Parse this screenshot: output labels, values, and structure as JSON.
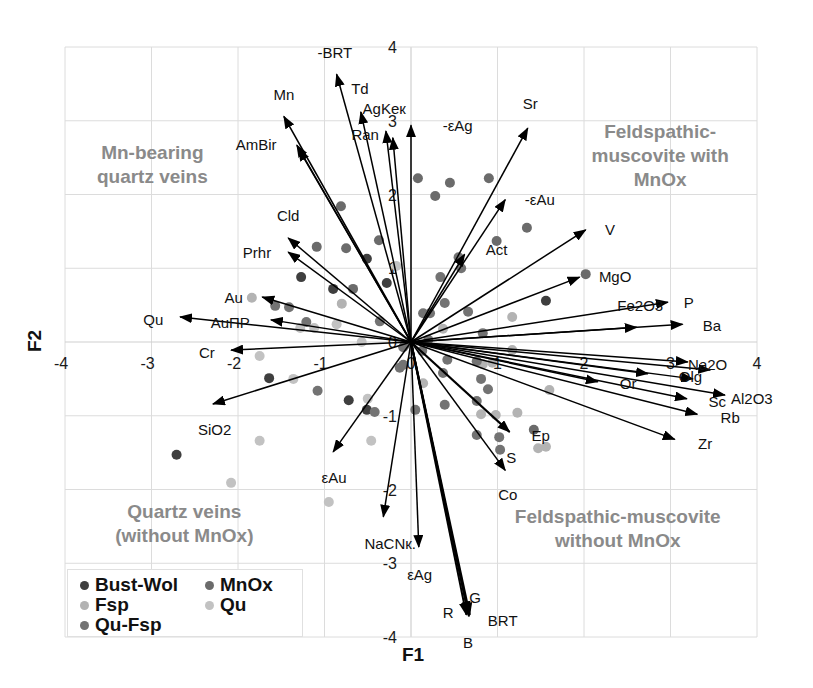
{
  "chart_data": {
    "type": "scatter",
    "subtype": "PCA biplot (points + variable vectors)",
    "title": "",
    "xlabel": "F1",
    "ylabel": "F2",
    "xlim": [
      -4,
      4
    ],
    "ylim": [
      -4,
      4
    ],
    "x_ticks": [
      -4,
      -3,
      -2,
      -1,
      0,
      1,
      2,
      3,
      4
    ],
    "y_ticks": [
      -4,
      -3,
      -2,
      -1,
      0,
      1,
      2,
      3,
      4
    ],
    "grid": true,
    "legend_position": "bottom-left",
    "series": [
      {
        "name": "Bust-Wol",
        "color": "#3f3f3f",
        "points": [
          [
            -0.51,
            1.13
          ],
          [
            -1.27,
            0.88
          ],
          [
            -0.28,
            0.8
          ],
          [
            1.56,
            0.56
          ],
          [
            -0.9,
            0.72
          ],
          [
            -1.64,
            -0.49
          ],
          [
            -0.72,
            -0.79
          ],
          [
            -0.51,
            -0.92
          ],
          [
            -2.71,
            -1.53
          ]
        ]
      },
      {
        "name": "MnOx",
        "color": "#6b6b6b",
        "points": [
          [
            0.08,
            2.22
          ],
          [
            0.45,
            2.16
          ],
          [
            0.9,
            2.22
          ],
          [
            0.28,
            1.98
          ],
          [
            -0.81,
            1.84
          ],
          [
            1.34,
            1.55
          ],
          [
            0.99,
            1.37
          ],
          [
            -1.09,
            1.29
          ],
          [
            -0.75,
            1.27
          ],
          [
            -0.37,
            1.38
          ],
          [
            2.02,
            0.92
          ],
          [
            -0.67,
            0.72
          ],
          [
            1.42,
            -1.19
          ]
        ]
      },
      {
        "name": "Fsp",
        "color": "#b3b3b3",
        "points": [
          [
            1.17,
            0.34
          ],
          [
            0.37,
            0.18
          ],
          [
            -1.84,
            0.6
          ],
          [
            -0.8,
            0.52
          ],
          [
            0.83,
            -0.3
          ],
          [
            0.94,
            -0.28
          ],
          [
            1.6,
            -0.65
          ],
          [
            0.81,
            -0.98
          ],
          [
            0.98,
            -0.99
          ],
          [
            1.23,
            -0.96
          ],
          [
            1.47,
            -1.44
          ],
          [
            1.56,
            -1.42
          ],
          [
            1.17,
            -0.11
          ],
          [
            0.14,
            -0.56
          ]
        ]
      },
      {
        "name": "Qu",
        "color": "#c2c2c2",
        "points": [
          [
            -0.17,
            1.03
          ],
          [
            -1.28,
            0.19
          ],
          [
            -1.12,
            0.19
          ],
          [
            -0.86,
            0.24
          ],
          [
            -0.57,
            0.0
          ],
          [
            -1.75,
            -0.19
          ],
          [
            -1.36,
            -0.5
          ],
          [
            -0.5,
            -0.77
          ],
          [
            -1.75,
            -1.34
          ],
          [
            -2.08,
            -1.91
          ],
          [
            -0.46,
            -1.34
          ],
          [
            -0.95,
            -2.17
          ]
        ]
      },
      {
        "name": "Qu-Fsp",
        "color": "#737373",
        "points": [
          [
            0.55,
            1.15
          ],
          [
            0.58,
            1.0
          ],
          [
            0.34,
            0.88
          ],
          [
            0.39,
            0.53
          ],
          [
            0.66,
            0.41
          ],
          [
            0.14,
            0.39
          ],
          [
            0.22,
            0.39
          ],
          [
            0.83,
            0.12
          ],
          [
            -1.57,
            0.49
          ],
          [
            -1.41,
            0.47
          ],
          [
            -1.21,
            0.27
          ],
          [
            -0.36,
            0.28
          ],
          [
            -1.08,
            -0.66
          ],
          [
            -0.42,
            -0.95
          ],
          [
            0.05,
            -0.92
          ],
          [
            -0.09,
            -0.07
          ],
          [
            -0.13,
            -0.35
          ],
          [
            -0.09,
            -0.31
          ],
          [
            -0.07,
            -0.04
          ],
          [
            0.2,
            0.03
          ],
          [
            0.13,
            -0.12
          ],
          [
            0.42,
            -0.24
          ],
          [
            0.76,
            -0.26
          ],
          [
            0.37,
            -0.42
          ],
          [
            0.81,
            -0.5
          ],
          [
            0.89,
            -0.64
          ],
          [
            0.39,
            -0.85
          ],
          [
            0.76,
            -0.8
          ],
          [
            0.76,
            -1.26
          ],
          [
            1.02,
            -1.29
          ],
          [
            1.03,
            -1.46
          ]
        ]
      }
    ],
    "vectors": [
      {
        "name": "Qu",
        "x": -2.67,
        "y": 0.34,
        "w": 1.5
      },
      {
        "name": "AuПР",
        "x": -1.62,
        "y": 0.3,
        "w": 1.5
      },
      {
        "name": "Au",
        "x": -1.72,
        "y": 0.61,
        "w": 1.5
      },
      {
        "name": "Prhr",
        "x": -1.42,
        "y": 1.22,
        "w": 1.5
      },
      {
        "name": "Cld",
        "x": -1.42,
        "y": 1.41,
        "w": 1.5
      },
      {
        "name": "AmBir",
        "x": -1.32,
        "y": 2.67,
        "w": 1.5
      },
      {
        "name": "AmBir-2",
        "x": -1.3,
        "y": 2.62,
        "w": 1.5
      },
      {
        "name": "Mn",
        "x": -1.47,
        "y": 3.06,
        "w": 1.6
      },
      {
        "name": "-BRT",
        "x": -0.86,
        "y": 3.63,
        "w": 1.5
      },
      {
        "name": "Td",
        "x": -0.58,
        "y": 3.12,
        "w": 1.5
      },
      {
        "name": "AgKeк",
        "x": -0.29,
        "y": 2.86,
        "w": 1.5
      },
      {
        "name": "Ran",
        "x": -0.21,
        "y": 2.77,
        "w": 1.5
      },
      {
        "name": "-εAg",
        "x": 0.0,
        "y": 2.94,
        "w": 1.5
      },
      {
        "name": "Sr",
        "x": 1.35,
        "y": 2.9,
        "w": 1.5
      },
      {
        "name": "-εAu",
        "x": 1.09,
        "y": 1.93,
        "w": 1.5
      },
      {
        "name": "Act",
        "x": 0.62,
        "y": 1.19,
        "w": 1.5
      },
      {
        "name": "V",
        "x": 2.02,
        "y": 1.52,
        "w": 1.5
      },
      {
        "name": "MgO",
        "x": 1.95,
        "y": 0.88,
        "w": 1.5
      },
      {
        "name": "P",
        "x": 2.97,
        "y": 0.54,
        "w": 1.5
      },
      {
        "name": "Fe2O3",
        "x": 2.61,
        "y": 0.2,
        "w": 1.5
      },
      {
        "name": "Ba",
        "x": 3.14,
        "y": 0.24,
        "w": 1.5
      },
      {
        "name": "Na2O",
        "x": 3.2,
        "y": -0.27,
        "w": 1.5
      },
      {
        "name": "Na2O-2",
        "x": 3.46,
        "y": -0.38,
        "w": 1.5
      },
      {
        "name": "Olg",
        "x": 3.26,
        "y": -0.5,
        "w": 1.5
      },
      {
        "name": "Olg-2",
        "x": 2.74,
        "y": -0.43,
        "w": 1.5
      },
      {
        "name": "Or",
        "x": 2.16,
        "y": -0.54,
        "w": 1.5
      },
      {
        "name": "Sc",
        "x": 3.19,
        "y": -0.77,
        "w": 1.5
      },
      {
        "name": "Al2O3",
        "x": 3.63,
        "y": -0.72,
        "w": 1.5
      },
      {
        "name": "Rb",
        "x": 3.31,
        "y": -0.98,
        "w": 1.5
      },
      {
        "name": "Zr",
        "x": 3.05,
        "y": -1.32,
        "w": 1.5
      },
      {
        "name": "Ep",
        "x": 1.14,
        "y": -1.22,
        "w": 2.2
      },
      {
        "name": "S-Co",
        "x": 1.09,
        "y": -1.74,
        "w": 1.5
      },
      {
        "name": "G",
        "x": 0.66,
        "y": -3.68,
        "w": 2.0
      },
      {
        "name": "R",
        "x": 0.64,
        "y": -3.7,
        "w": 2.0
      },
      {
        "name": "B",
        "x": 0.67,
        "y": -3.72,
        "w": 2.0
      },
      {
        "name": "BRT",
        "x": 0.68,
        "y": -3.7,
        "w": 2.0
      },
      {
        "name": "εAg",
        "x": 0.09,
        "y": -2.78,
        "w": 1.5
      },
      {
        "name": "NaCNк.",
        "x": -0.32,
        "y": -2.37,
        "w": 1.5
      },
      {
        "name": "εAu",
        "x": -0.9,
        "y": -1.49,
        "w": 1.5
      },
      {
        "name": "SiO2",
        "x": -2.29,
        "y": -0.84,
        "w": 1.5
      },
      {
        "name": "Cr",
        "x": -2.08,
        "y": -0.11,
        "w": 1.5
      }
    ],
    "vector_labels": [
      {
        "text": "-BRT",
        "x": -0.88,
        "y": 3.92
      },
      {
        "text": "Td",
        "x": -0.59,
        "y": 3.44
      },
      {
        "text": "AgKeк",
        "x": -0.31,
        "y": 3.17
      },
      {
        "text": "Ran",
        "x": -0.53,
        "y": 2.81
      },
      {
        "text": "-εAg",
        "x": 0.54,
        "y": 2.94,
        "color": "#7a7a7a"
      },
      {
        "text": "Mn",
        "x": -1.47,
        "y": 3.36
      },
      {
        "text": "AmBir",
        "x": -1.79,
        "y": 2.68
      },
      {
        "text": "Cld",
        "x": -1.42,
        "y": 1.72
      },
      {
        "text": "Prhr",
        "x": -1.78,
        "y": 1.22
      },
      {
        "text": "Au",
        "x": -2.05,
        "y": 0.6
      },
      {
        "text": "Qu",
        "x": -2.98,
        "y": 0.31
      },
      {
        "text": "AuПР",
        "x": -2.09,
        "y": 0.26
      },
      {
        "text": "Cr",
        "x": -2.36,
        "y": -0.14
      },
      {
        "text": "SiO2",
        "x": -2.27,
        "y": -1.19
      },
      {
        "text": "εAu",
        "x": -0.89,
        "y": -1.84
      },
      {
        "text": "NaCNк.",
        "x": -0.24,
        "y": -2.73
      },
      {
        "text": "εAg",
        "x": 0.1,
        "y": -3.15,
        "color": "#7a7a7a"
      },
      {
        "text": "R",
        "x": 0.43,
        "y": -3.67
      },
      {
        "text": "G",
        "x": 0.74,
        "y": -3.46
      },
      {
        "text": "BRT",
        "x": 1.06,
        "y": -3.77
      },
      {
        "text": "B",
        "x": 0.66,
        "y": -4.07
      },
      {
        "text": "Co",
        "x": 1.12,
        "y": -2.07
      },
      {
        "text": "S",
        "x": 1.16,
        "y": -1.57
      },
      {
        "text": "Ep",
        "x": 1.5,
        "y": -1.27
      },
      {
        "text": "Zr",
        "x": 3.4,
        "y": -1.37
      },
      {
        "text": "Rb",
        "x": 3.69,
        "y": -1.02
      },
      {
        "text": "Sc",
        "x": 3.54,
        "y": -0.8
      },
      {
        "text": "Al2O3",
        "x": 3.94,
        "y": -0.77
      },
      {
        "text": "Or",
        "x": 2.51,
        "y": -0.56
      },
      {
        "text": "Olg",
        "x": 3.23,
        "y": -0.47
      },
      {
        "text": "Na2O",
        "x": 3.43,
        "y": -0.3
      },
      {
        "text": "Ba",
        "x": 3.48,
        "y": 0.23
      },
      {
        "text": "P",
        "x": 3.21,
        "y": 0.54
      },
      {
        "text": "Fe2O3",
        "x": 2.65,
        "y": 0.5
      },
      {
        "text": "MgO",
        "x": 2.36,
        "y": 0.89
      },
      {
        "text": "V",
        "x": 2.3,
        "y": 1.52
      },
      {
        "text": "Act",
        "x": 0.99,
        "y": 1.26
      },
      {
        "text": "-εAu",
        "x": 1.49,
        "y": 1.93
      },
      {
        "text": "Sr",
        "x": 1.38,
        "y": 3.23
      }
    ],
    "annotations": [
      {
        "name": "region-mn-bearing-quartz-veins",
        "x": -2.99,
        "y": 2.58,
        "lines": [
          "Mn-bearing",
          "quartz veins"
        ]
      },
      {
        "name": "region-feldspathic-muscovite-with-mnox",
        "x": 2.88,
        "y": 2.86,
        "lines": [
          "Feldspathic-",
          "muscovite with",
          "MnOx"
        ]
      },
      {
        "name": "region-quartz-veins-without-mnox",
        "x": -2.62,
        "y": -2.29,
        "lines": [
          "Quartz veins",
          "(without MnOx)"
        ]
      },
      {
        "name": "region-feldspathic-muscovite-without-mnox",
        "x": 2.39,
        "y": -2.36,
        "lines": [
          "Feldspathic-muscovite",
          "without MnOx"
        ]
      }
    ],
    "annotation_color": "#8a8a8a"
  }
}
